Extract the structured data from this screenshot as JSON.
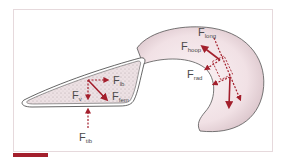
{
  "colors": {
    "force": "#a31f2c",
    "outline": "#555555",
    "frame": "#e6d9dc",
    "crescent_fill": "#f3e4e7",
    "triangle_fill": "#ecdfe2",
    "accent_bar": "#a31f2c"
  },
  "left_shape": {
    "name": "triangular cross-section",
    "labels": [
      {
        "main": "F",
        "sub": "lb"
      },
      {
        "main": "F",
        "sub": "v"
      },
      {
        "main": "F",
        "sub": "fem"
      },
      {
        "main": "F",
        "sub": "tib"
      }
    ]
  },
  "right_shape": {
    "name": "crescent / meniscus",
    "labels": [
      {
        "main": "F",
        "sub": "long"
      },
      {
        "main": "F",
        "sub": "hoop"
      },
      {
        "main": "F",
        "sub": "rad"
      }
    ]
  }
}
